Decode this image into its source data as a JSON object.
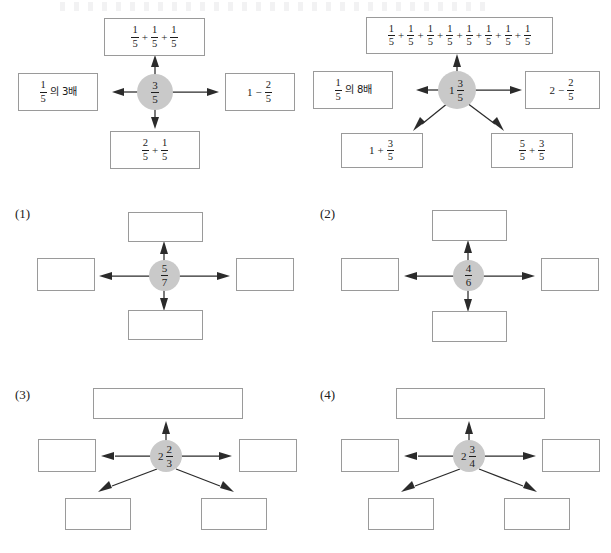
{
  "page": {
    "kind": "math-worksheet",
    "topic": "fraction-equivalent-expression-web",
    "background_color": "#ffffff",
    "hub_fill_color": "#c9c9c9",
    "box_border_color": "#9a9a9a",
    "arrow_color": "#2b2b2b"
  },
  "examples": [
    {
      "id": "example-1",
      "label": "",
      "center": {
        "whole": "",
        "num": "3",
        "den": "5",
        "display": "3/5"
      },
      "boxes": [
        {
          "position": "top",
          "filled": true,
          "display": "1/5 + 1/5 + 1/5",
          "parts": [
            {
              "type": "fraction",
              "num": "1",
              "den": "5"
            },
            {
              "type": "operator",
              "symbol": "+"
            },
            {
              "type": "fraction",
              "num": "1",
              "den": "5"
            },
            {
              "type": "operator",
              "symbol": "+"
            },
            {
              "type": "fraction",
              "num": "1",
              "den": "5"
            }
          ]
        },
        {
          "position": "left",
          "filled": true,
          "display": "1/5의 3배",
          "parts": [
            {
              "type": "fraction",
              "num": "1",
              "den": "5"
            },
            {
              "type": "text",
              "symbol": "의 3배"
            }
          ]
        },
        {
          "position": "right",
          "filled": true,
          "display": "1 - 2/5",
          "parts": [
            {
              "type": "whole",
              "symbol": "1"
            },
            {
              "type": "operator",
              "symbol": "−"
            },
            {
              "type": "fraction",
              "num": "2",
              "den": "5"
            }
          ]
        },
        {
          "position": "bottom",
          "filled": true,
          "display": "2/5 + 1/5",
          "parts": [
            {
              "type": "fraction",
              "num": "2",
              "den": "5"
            },
            {
              "type": "operator",
              "symbol": "+"
            },
            {
              "type": "fraction",
              "num": "1",
              "den": "5"
            }
          ]
        }
      ]
    },
    {
      "id": "example-2",
      "label": "",
      "center": {
        "whole": "1",
        "num": "3",
        "den": "5",
        "display": "1 3/5"
      },
      "boxes": [
        {
          "position": "top",
          "filled": true,
          "display": "1/5 + 1/5 + 1/5 + 1/5 + 1/5 + 1/5 + 1/5 + 1/5",
          "parts": [
            {
              "type": "fraction",
              "num": "1",
              "den": "5"
            },
            {
              "type": "operator",
              "symbol": "+"
            },
            {
              "type": "fraction",
              "num": "1",
              "den": "5"
            },
            {
              "type": "operator",
              "symbol": "+"
            },
            {
              "type": "fraction",
              "num": "1",
              "den": "5"
            },
            {
              "type": "operator",
              "symbol": "+"
            },
            {
              "type": "fraction",
              "num": "1",
              "den": "5"
            },
            {
              "type": "operator",
              "symbol": "+"
            },
            {
              "type": "fraction",
              "num": "1",
              "den": "5"
            },
            {
              "type": "operator",
              "symbol": "+"
            },
            {
              "type": "fraction",
              "num": "1",
              "den": "5"
            },
            {
              "type": "operator",
              "symbol": "+"
            },
            {
              "type": "fraction",
              "num": "1",
              "den": "5"
            },
            {
              "type": "operator",
              "symbol": "+"
            },
            {
              "type": "fraction",
              "num": "1",
              "den": "5"
            }
          ]
        },
        {
          "position": "left",
          "filled": true,
          "display": "1/5의 8배",
          "parts": [
            {
              "type": "fraction",
              "num": "1",
              "den": "5"
            },
            {
              "type": "text",
              "symbol": "의 8배"
            }
          ]
        },
        {
          "position": "right",
          "filled": true,
          "display": "2 - 2/5",
          "parts": [
            {
              "type": "whole",
              "symbol": "2"
            },
            {
              "type": "operator",
              "symbol": "−"
            },
            {
              "type": "fraction",
              "num": "2",
              "den": "5"
            }
          ]
        },
        {
          "position": "bottom-left",
          "filled": true,
          "display": "1 + 3/5",
          "parts": [
            {
              "type": "whole",
              "symbol": "1"
            },
            {
              "type": "operator",
              "symbol": "+"
            },
            {
              "type": "fraction",
              "num": "3",
              "den": "5"
            }
          ]
        },
        {
          "position": "bottom-right",
          "filled": true,
          "display": "5/5 + 3/5",
          "parts": [
            {
              "type": "fraction",
              "num": "5",
              "den": "5"
            },
            {
              "type": "operator",
              "symbol": "+"
            },
            {
              "type": "fraction",
              "num": "3",
              "den": "5"
            }
          ]
        }
      ]
    }
  ],
  "problems": [
    {
      "id": "problem-1",
      "label": "(1)",
      "center": {
        "whole": "",
        "num": "5",
        "den": "7",
        "display": "5/7"
      },
      "layout": "four-way",
      "boxes": [
        {
          "position": "top",
          "filled": false,
          "display": ""
        },
        {
          "position": "left",
          "filled": false,
          "display": ""
        },
        {
          "position": "right",
          "filled": false,
          "display": ""
        },
        {
          "position": "bottom",
          "filled": false,
          "display": ""
        }
      ]
    },
    {
      "id": "problem-2",
      "label": "(2)",
      "center": {
        "whole": "",
        "num": "4",
        "den": "6",
        "display": "4/6"
      },
      "layout": "four-way",
      "boxes": [
        {
          "position": "top",
          "filled": false,
          "display": ""
        },
        {
          "position": "left",
          "filled": false,
          "display": ""
        },
        {
          "position": "right",
          "filled": false,
          "display": ""
        },
        {
          "position": "bottom",
          "filled": false,
          "display": ""
        }
      ]
    },
    {
      "id": "problem-3",
      "label": "(3)",
      "center": {
        "whole": "2",
        "num": "2",
        "den": "3",
        "display": "2 2/3"
      },
      "layout": "five-way",
      "boxes": [
        {
          "position": "top",
          "filled": false,
          "display": ""
        },
        {
          "position": "left",
          "filled": false,
          "display": ""
        },
        {
          "position": "right",
          "filled": false,
          "display": ""
        },
        {
          "position": "bottom-left",
          "filled": false,
          "display": ""
        },
        {
          "position": "bottom-right",
          "filled": false,
          "display": ""
        }
      ]
    },
    {
      "id": "problem-4",
      "label": "(4)",
      "center": {
        "whole": "2",
        "num": "3",
        "den": "4",
        "display": "2 3/4"
      },
      "layout": "five-way",
      "boxes": [
        {
          "position": "top",
          "filled": false,
          "display": ""
        },
        {
          "position": "left",
          "filled": false,
          "display": ""
        },
        {
          "position": "right",
          "filled": false,
          "display": ""
        },
        {
          "position": "bottom-left",
          "filled": false,
          "display": ""
        },
        {
          "position": "bottom-right",
          "filled": false,
          "display": ""
        }
      ]
    }
  ]
}
